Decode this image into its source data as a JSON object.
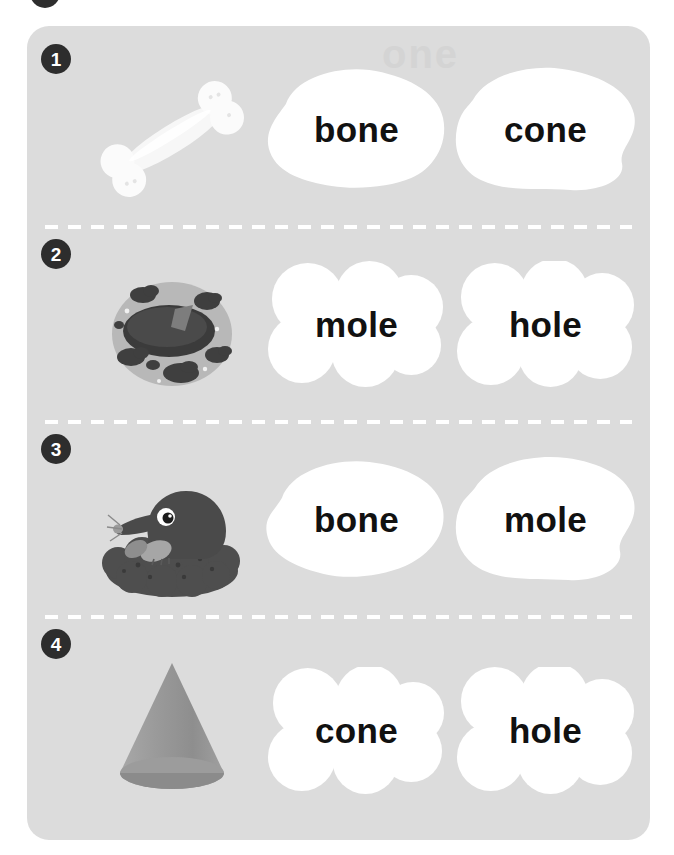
{
  "worksheet": {
    "ghost_text": "one",
    "card_background": "#dcdcdc",
    "page_background": "#ffffff",
    "badge_color": "#2d2d2d",
    "word_color": "#111111",
    "blob_color": "#ffffff",
    "divider_color": "#ffffff",
    "rows": [
      {
        "number": "1",
        "picture": "bone-illustration",
        "picture_label": "bone",
        "options": [
          "bone",
          "cone"
        ],
        "blob_style": "puddle"
      },
      {
        "number": "2",
        "picture": "hole-illustration",
        "picture_label": "hole",
        "options": [
          "mole",
          "hole"
        ],
        "blob_style": "cloud"
      },
      {
        "number": "3",
        "picture": "mole-illustration",
        "picture_label": "mole",
        "options": [
          "bone",
          "mole"
        ],
        "blob_style": "puddle"
      },
      {
        "number": "4",
        "picture": "cone-illustration",
        "picture_label": "cone",
        "options": [
          "cone",
          "hole"
        ],
        "blob_style": "cloud"
      }
    ]
  }
}
